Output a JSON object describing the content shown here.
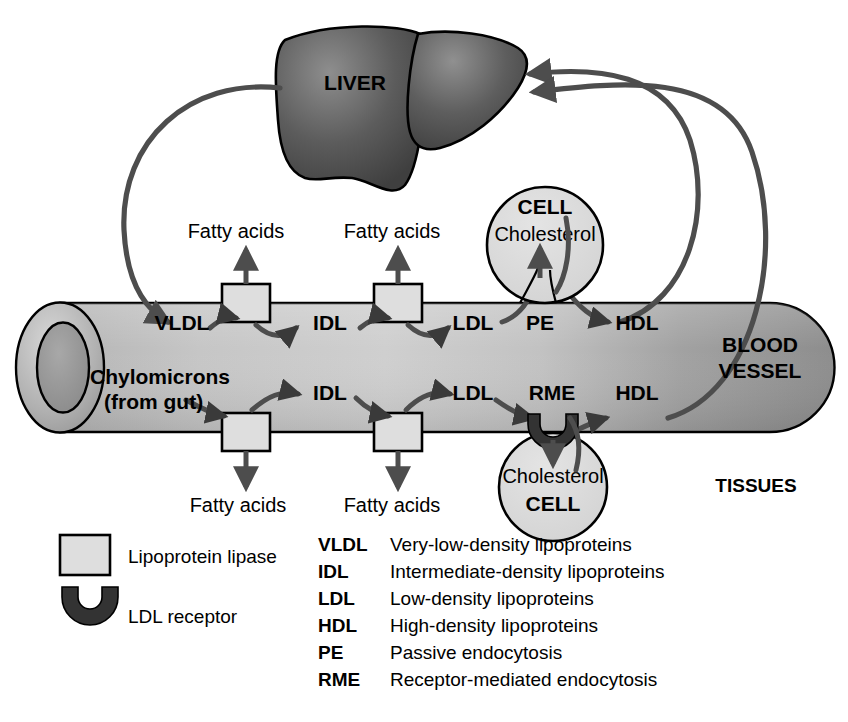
{
  "diagram": {
    "title_hidden": "Lipoprotein metabolism pathway",
    "organs": {
      "liver_label": "LIVER"
    },
    "vessel": {
      "label_line1": "BLOOD",
      "label_line2": "VESSEL",
      "tissues_label": "TISSUES"
    },
    "flow_top": {
      "vldl": "VLDL",
      "idl": "IDL",
      "ldl": "LDL",
      "pe": "PE",
      "hdl": "HDL",
      "fatty_acids_1": "Fatty acids",
      "fatty_acids_2": "Fatty acids"
    },
    "flow_bottom": {
      "chylomicrons_line1": "Chylomicrons",
      "chylomicrons_line2": "(from gut)",
      "idl": "IDL",
      "ldl": "LDL",
      "rme": "RME",
      "hdl": "HDL",
      "fatty_acids_1": "Fatty acids",
      "fatty_acids_2": "Fatty acids"
    },
    "cell_top": {
      "name": "CELL",
      "content": "Cholesterol"
    },
    "cell_bottom": {
      "name": "CELL",
      "content": "Cholesterol"
    }
  },
  "legend_symbols": [
    {
      "symbol": "square-swatch",
      "label": "Lipoprotein lipase"
    },
    {
      "symbol": "cup-receptor-swatch",
      "label": "LDL receptor"
    }
  ],
  "legend_abbreviations": [
    {
      "abbr": "VLDL",
      "desc": "Very-low-density lipoproteins"
    },
    {
      "abbr": "IDL",
      "desc": "Intermediate-density lipoproteins"
    },
    {
      "abbr": "LDL",
      "desc": "Low-density lipoproteins"
    },
    {
      "abbr": "HDL",
      "desc": "High-density lipoproteins"
    },
    {
      "abbr": "PE",
      "desc": "Passive endocytosis"
    },
    {
      "abbr": "RME",
      "desc": "Receptor-mediated endocytosis"
    }
  ],
  "colors": {
    "background": "#ffffff",
    "outline": "#000000",
    "arrow_gray": "#4d4d4d",
    "liver_dark": "#4a4a4a",
    "liver_light": "#8c8c8c",
    "vessel_light": "#c9c9c9",
    "vessel_dark": "#8f8f8f",
    "cell_fill": "#dcdcdc",
    "lipase_fill": "#dedede",
    "receptor_fill": "#333333"
  }
}
